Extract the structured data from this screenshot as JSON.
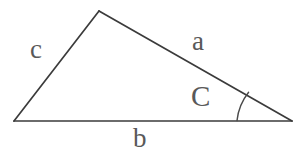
{
  "diagram": {
    "type": "triangle",
    "background_color": "#ffffff",
    "line_color": "#3b3b3b",
    "label_color": "#595959",
    "arc_color": "#4a4a4a",
    "vertices": {
      "left": {
        "x": 14,
        "y": 121
      },
      "apex": {
        "x": 99,
        "y": 11
      },
      "right": {
        "x": 292,
        "y": 121
      }
    },
    "edges": [
      {
        "name": "side-a",
        "label": "a",
        "from": "apex",
        "to": "right"
      },
      {
        "name": "side-b",
        "label": "b",
        "from": "left",
        "to": "right"
      },
      {
        "name": "side-c",
        "label": "c",
        "from": "left",
        "to": "apex"
      }
    ],
    "labels": {
      "side_a": "a",
      "side_b": "b",
      "side_c": "c",
      "angle_C": "C"
    },
    "angle_marker": {
      "at_vertex": "right",
      "label": "C",
      "arc_start": {
        "x": 237,
        "y": 121
      },
      "arc_end": {
        "x": 249,
        "y": 92
      },
      "radius": 55
    }
  }
}
